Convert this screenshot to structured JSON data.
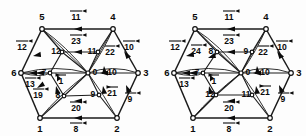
{
  "figure": {
    "caption": "",
    "type": "graph-pair"
  },
  "colors": {
    "line": "#1a1a1a",
    "text": "#0b0b0b",
    "node_fill": "#ffffff",
    "background": "#ffffff"
  },
  "left": {
    "name": "left-graph",
    "vertices": [
      {
        "id": "v6",
        "label": "6",
        "x": 14,
        "y": 73
      },
      {
        "id": "v5",
        "label": "5",
        "x": 42,
        "y": 17
      },
      {
        "id": "v4",
        "label": "4",
        "x": 113,
        "y": 17
      },
      {
        "id": "v3",
        "label": "3",
        "x": 146,
        "y": 73
      },
      {
        "id": "v2",
        "label": "2",
        "x": 117,
        "y": 129
      },
      {
        "id": "v1",
        "label": "1",
        "x": 40,
        "y": 129
      }
    ],
    "inner_vertices": [
      {
        "id": "i12",
        "label": "12",
        "x": 56,
        "y": 52
      },
      {
        "id": "i11",
        "label": "11",
        "x": 92,
        "y": 52
      },
      {
        "id": "i7",
        "label": "7",
        "x": 44,
        "y": 73
      },
      {
        "id": "i0",
        "label": "0",
        "x": 95,
        "y": 73
      },
      {
        "id": "i10",
        "label": "10",
        "x": 112,
        "y": 73
      },
      {
        "id": "i8",
        "label": "8",
        "x": 58,
        "y": 96
      },
      {
        "id": "i9",
        "label": "9",
        "x": 93,
        "y": 95
      }
    ],
    "edge_labels": [
      {
        "id": "e11",
        "label": "11",
        "x": 76,
        "y": 17
      },
      {
        "id": "e23",
        "label": "23",
        "x": 76,
        "y": 41
      },
      {
        "id": "e12",
        "label": "12",
        "x": 22,
        "y": 47
      },
      {
        "id": "e10",
        "label": "10",
        "x": 129,
        "y": 47
      },
      {
        "id": "e22",
        "label": "22",
        "x": 110,
        "y": 53
      },
      {
        "id": "e1",
        "label": "1",
        "x": 61,
        "y": 80
      },
      {
        "id": "e13",
        "label": "13",
        "x": 30,
        "y": 84
      },
      {
        "id": "e19",
        "label": "19",
        "x": 38,
        "y": 95
      },
      {
        "id": "e21",
        "label": "21",
        "x": 112,
        "y": 93
      },
      {
        "id": "e9",
        "label": "9",
        "x": 130,
        "y": 99
      },
      {
        "id": "e20",
        "label": "20",
        "x": 76,
        "y": 108
      },
      {
        "id": "e8",
        "label": "8",
        "x": 76,
        "y": 129
      }
    ]
  },
  "right": {
    "name": "right-graph",
    "vertices": [
      {
        "id": "v6",
        "label": "6",
        "x": 14,
        "y": 73
      },
      {
        "id": "v5",
        "label": "5",
        "x": 42,
        "y": 17
      },
      {
        "id": "v4",
        "label": "4",
        "x": 113,
        "y": 17
      },
      {
        "id": "v3",
        "label": "3",
        "x": 146,
        "y": 73
      },
      {
        "id": "v2",
        "label": "2",
        "x": 117,
        "y": 129
      },
      {
        "id": "v1",
        "label": "1",
        "x": 40,
        "y": 129
      }
    ],
    "inner_vertices": [
      {
        "id": "i8",
        "label": "8",
        "x": 58,
        "y": 52
      },
      {
        "id": "i9",
        "label": "9",
        "x": 93,
        "y": 52
      },
      {
        "id": "i7",
        "label": "7",
        "x": 44,
        "y": 73
      },
      {
        "id": "i0",
        "label": "0",
        "x": 95,
        "y": 73
      },
      {
        "id": "i10",
        "label": "10",
        "x": 112,
        "y": 73
      },
      {
        "id": "i12",
        "label": "12",
        "x": 57,
        "y": 95
      },
      {
        "id": "i11",
        "label": "11",
        "x": 93,
        "y": 95
      }
    ],
    "edge_labels": [
      {
        "id": "e11",
        "label": "11",
        "x": 76,
        "y": 17
      },
      {
        "id": "e23",
        "label": "23",
        "x": 76,
        "y": 41
      },
      {
        "id": "e12",
        "label": "12",
        "x": 22,
        "y": 47
      },
      {
        "id": "e24",
        "label": "24",
        "x": 43,
        "y": 51
      },
      {
        "id": "e22",
        "label": "22",
        "x": 110,
        "y": 52
      },
      {
        "id": "e10",
        "label": "10",
        "x": 129,
        "y": 47
      },
      {
        "id": "e13",
        "label": "13",
        "x": 31,
        "y": 84
      },
      {
        "id": "e1",
        "label": "1",
        "x": 61,
        "y": 81
      },
      {
        "id": "e21",
        "label": "21",
        "x": 112,
        "y": 92
      },
      {
        "id": "e9",
        "label": "9",
        "x": 130,
        "y": 99
      },
      {
        "id": "e20",
        "label": "20",
        "x": 76,
        "y": 108
      },
      {
        "id": "e8",
        "label": "8",
        "x": 76,
        "y": 129
      }
    ]
  }
}
